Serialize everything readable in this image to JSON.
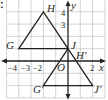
{
  "figure": {
    "marker": ":",
    "grid": {
      "x_min": -5,
      "x_max": 3,
      "y_min": -3,
      "y_max": 5,
      "color": "#c8c8c8"
    },
    "axes": {
      "x_label": "x",
      "y_label": "y",
      "origin_label": "O",
      "x_ticks": [
        {
          "value": -4,
          "label": "−4"
        },
        {
          "value": -3,
          "label": "−3"
        },
        {
          "value": -2,
          "label": "−2"
        },
        {
          "value": 2,
          "label": "2"
        }
      ],
      "y_ticks": [
        {
          "value": 4,
          "label": "4"
        },
        {
          "value": 3,
          "label": "3"
        }
      ],
      "color": "#231f20"
    },
    "triangles": [
      {
        "name": "GHJ",
        "vertices": [
          {
            "label": "G",
            "x": -4,
            "y": 1
          },
          {
            "label": "H",
            "x": -2,
            "y": 4
          },
          {
            "label": "J",
            "x": 0,
            "y": 1
          }
        ]
      },
      {
        "name": "G'H'J'",
        "vertices": [
          {
            "label": "G′",
            "x": -2,
            "y": -2
          },
          {
            "label": "H′",
            "x": 0,
            "y": 1
          },
          {
            "label": "J′",
            "x": 2,
            "y": -2
          }
        ]
      }
    ],
    "line_color": "#231f20"
  }
}
